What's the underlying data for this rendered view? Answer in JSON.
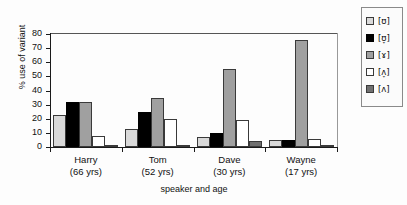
{
  "chart_data": {
    "type": "bar",
    "title": "",
    "xlabel": "speaker and age",
    "ylabel": "% use of variant",
    "ylim": [
      0,
      80
    ],
    "yticks": [
      0,
      10,
      20,
      30,
      40,
      50,
      60,
      70,
      80
    ],
    "grid": false,
    "legend_position": "right",
    "categories": [
      "Harry\n(66 yrs)",
      "Tom\n(52 yrs)",
      "Dave\n(30 yrs)",
      "Wayne\n(17 yrs)"
    ],
    "category_names": [
      "Harry",
      "Tom",
      "Dave",
      "Wayne"
    ],
    "category_ages": [
      "(66 yrs)",
      "(52 yrs)",
      "(30 yrs)",
      "(17 yrs)"
    ],
    "series": [
      {
        "name": "[ʊ]",
        "color": "#d9d9d9",
        "values": [
          23,
          13,
          7,
          5
        ]
      },
      {
        "name": "[ʊ̞]",
        "color": "#000000",
        "values": [
          32,
          25,
          10,
          5
        ]
      },
      {
        "name": "[ɤ]",
        "color": "#a0a0a0",
        "values": [
          32,
          35,
          55,
          76
        ]
      },
      {
        "name": "[ʌ̞]",
        "color": "#ffffff",
        "values": [
          8,
          20,
          19,
          6
        ]
      },
      {
        "name": "[ʌ]",
        "color": "#707070",
        "values": [
          1,
          1,
          4,
          1
        ]
      }
    ]
  },
  "axes": {
    "y_title": "% use of variant",
    "x_title": "speaker and age",
    "y_tick_labels": [
      "80",
      "70",
      "60",
      "50",
      "40",
      "30",
      "20",
      "10",
      "0"
    ]
  },
  "legend": {
    "items": [
      {
        "label": "[ʊ]",
        "swatch": "#d9d9d9"
      },
      {
        "label": "[ʊ̞]",
        "swatch": "#000000"
      },
      {
        "label": "[ɤ]",
        "swatch": "#a0a0a0"
      },
      {
        "label": "[ʌ̞]",
        "swatch": "#ffffff"
      },
      {
        "label": "[ʌ]",
        "swatch": "#707070"
      }
    ]
  }
}
